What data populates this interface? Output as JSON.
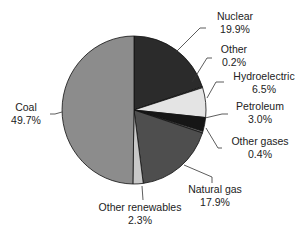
{
  "chart_data": {
    "type": "pie",
    "title": "",
    "slices": [
      {
        "label": "Nuclear",
        "value": 19.9,
        "display": "19.9%",
        "color": "#2b2b2b"
      },
      {
        "label": "Other",
        "value": 0.2,
        "display": "0.2%",
        "color": "#9a9a9a"
      },
      {
        "label": "Hydroelectric",
        "value": 6.5,
        "display": "6.5%",
        "color": "#e4e4e4"
      },
      {
        "label": "Petroleum",
        "value": 3.0,
        "display": "3.0%",
        "color": "#161616"
      },
      {
        "label": "Other gases",
        "value": 0.4,
        "display": "0.4%",
        "color": "#6e6e6e"
      },
      {
        "label": "Natural gas",
        "value": 17.9,
        "display": "17.9%",
        "color": "#4e4e4e"
      },
      {
        "label": "Other renewables",
        "value": 2.3,
        "display": "2.3%",
        "color": "#c8c8c8"
      },
      {
        "label": "Coal",
        "value": 49.7,
        "display": "49.7%",
        "color": "#8c8c8c"
      }
    ],
    "start_angle": "top, clockwise",
    "legend": "none (direct labels with leader lines)"
  },
  "labels": {
    "nuclear": {
      "name": "Nuclear",
      "pct": "19.9%"
    },
    "other": {
      "name": "Other",
      "pct": "0.2%"
    },
    "hydro": {
      "name": "Hydroelectric",
      "pct": "6.5%"
    },
    "petroleum": {
      "name": "Petroleum",
      "pct": "3.0%"
    },
    "other_gases": {
      "name": "Other gases",
      "pct": "0.4%"
    },
    "natural_gas": {
      "name": "Natural gas",
      "pct": "17.9%"
    },
    "other_renewables": {
      "name": "Other renewables",
      "pct": "2.3%"
    },
    "coal": {
      "name": "Coal",
      "pct": "49.7%"
    }
  }
}
